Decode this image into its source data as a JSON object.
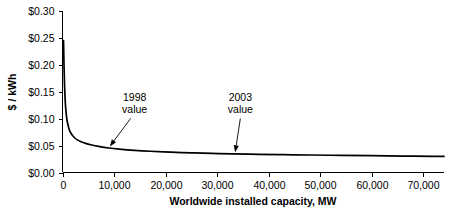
{
  "chart_data": {
    "type": "line",
    "title": "",
    "subtitle": "",
    "xlabel": "Worldwide installed capacity, MW",
    "ylabel": "$ / kWh",
    "xlim": [
      0,
      74000
    ],
    "ylim": [
      0,
      0.3
    ],
    "grid": false,
    "legend": "none",
    "x_ticks": [
      0,
      10000,
      20000,
      30000,
      40000,
      50000,
      60000,
      70000
    ],
    "x_tick_labels": [
      "0",
      "10,000",
      "20,000",
      "30,000",
      "40,000",
      "50,000",
      "60,000",
      "70,000"
    ],
    "y_ticks": [
      0.0,
      0.05,
      0.1,
      0.15,
      0.2,
      0.25,
      0.3
    ],
    "y_tick_labels": [
      "$0.00",
      "$0.05",
      "$0.10",
      "$0.15",
      "$0.20",
      "$0.25",
      "$0.30"
    ],
    "series": [
      {
        "name": "cost curve",
        "x": [
          200,
          300,
          400,
          500,
          600,
          800,
          1000,
          1300,
          1700,
          2200,
          2800,
          3600,
          4500,
          5500,
          7000,
          9000,
          11000,
          14000,
          17000,
          21000,
          25000,
          29000,
          33000,
          38000,
          43000,
          48000,
          54000,
          60000,
          66000,
          72000,
          74000
        ],
        "y": [
          0.245,
          0.196,
          0.162,
          0.138,
          0.122,
          0.102,
          0.091,
          0.08,
          0.072,
          0.066,
          0.061,
          0.057,
          0.054,
          0.0515,
          0.0485,
          0.0455,
          0.0435,
          0.0412,
          0.0395,
          0.0378,
          0.0365,
          0.0355,
          0.0347,
          0.0338,
          0.0331,
          0.0325,
          0.0318,
          0.0312,
          0.0306,
          0.0301,
          0.0299
        ]
      }
    ],
    "annotations": [
      {
        "id": "annotation-1998",
        "line1": "1998",
        "line2": "value",
        "text_x": 14000,
        "text_y": 0.132,
        "point_x": 9200,
        "point_y": 0.0455,
        "arrow": "diagonal"
      },
      {
        "id": "annotation-2003",
        "line1": "2003",
        "line2": "value",
        "text_x": 34500,
        "text_y": 0.132,
        "point_x": 33500,
        "point_y": 0.0347,
        "arrow": "vertical"
      }
    ]
  },
  "colors": {
    "curve": "#000000",
    "axis": "#000000",
    "background": "#ffffff",
    "text": "#000000"
  }
}
